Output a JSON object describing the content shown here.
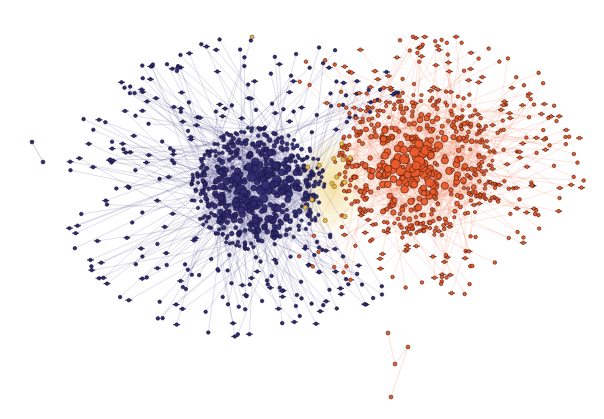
{
  "diagram": {
    "type": "network-graph",
    "background": "#ffffff",
    "width": 604,
    "height": 419,
    "clusters": [
      {
        "name": "blue-community",
        "center": [
          258,
          188
        ],
        "core_radius": [
          68,
          62
        ],
        "halo_radius": [
          200,
          185
        ],
        "core_nodes": 520,
        "halo_nodes": 260,
        "node_fill": "#2e2a6e",
        "node_stroke": "#14123a",
        "edge_color": "#3a3680",
        "edge_opacity": 0.28,
        "halo_bias_angle": 180,
        "seed": 11
      },
      {
        "name": "orange-community",
        "center": [
          415,
          165
        ],
        "core_radius": [
          80,
          72
        ],
        "halo_radius": [
          170,
          165
        ],
        "core_nodes": 470,
        "halo_nodes": 240,
        "node_fill": "#ea5a2a",
        "node_stroke": "#4a1a0c",
        "edge_color": "#ef7a52",
        "edge_opacity": 0.3,
        "halo_bias_angle": 0,
        "seed": 23
      }
    ],
    "bridge": {
      "name": "yellow-bridge",
      "center": [
        332,
        185
      ],
      "radius": [
        34,
        52
      ],
      "color": "#e9c85a",
      "opacity": 0.55,
      "stray_nodes": 14
    },
    "outliers": [
      {
        "x": 32,
        "y": 142,
        "to": [
          43,
          162
        ],
        "color": "#2e2a6e"
      },
      {
        "x": 252,
        "y": 37,
        "color": "#f0b45a"
      },
      {
        "x": 388,
        "y": 333,
        "color": "#ea5a2a"
      },
      {
        "x": 395,
        "y": 364,
        "color": "#ea5a2a"
      },
      {
        "x": 408,
        "y": 347,
        "color": "#ea5a2a"
      },
      {
        "x": 391,
        "y": 397,
        "color": "#ea5a2a"
      }
    ]
  }
}
